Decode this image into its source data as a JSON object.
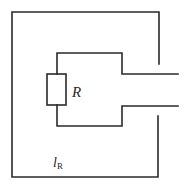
{
  "diagram": {
    "type": "circuit-loop",
    "components": [
      {
        "id": "resistor",
        "label": "R"
      }
    ],
    "labels": {
      "resistor_label": "R",
      "loop_label_main": "l",
      "loop_label_sub": "R"
    },
    "colors": {
      "line": "#2a2a2a",
      "background": "#ffffff"
    }
  }
}
